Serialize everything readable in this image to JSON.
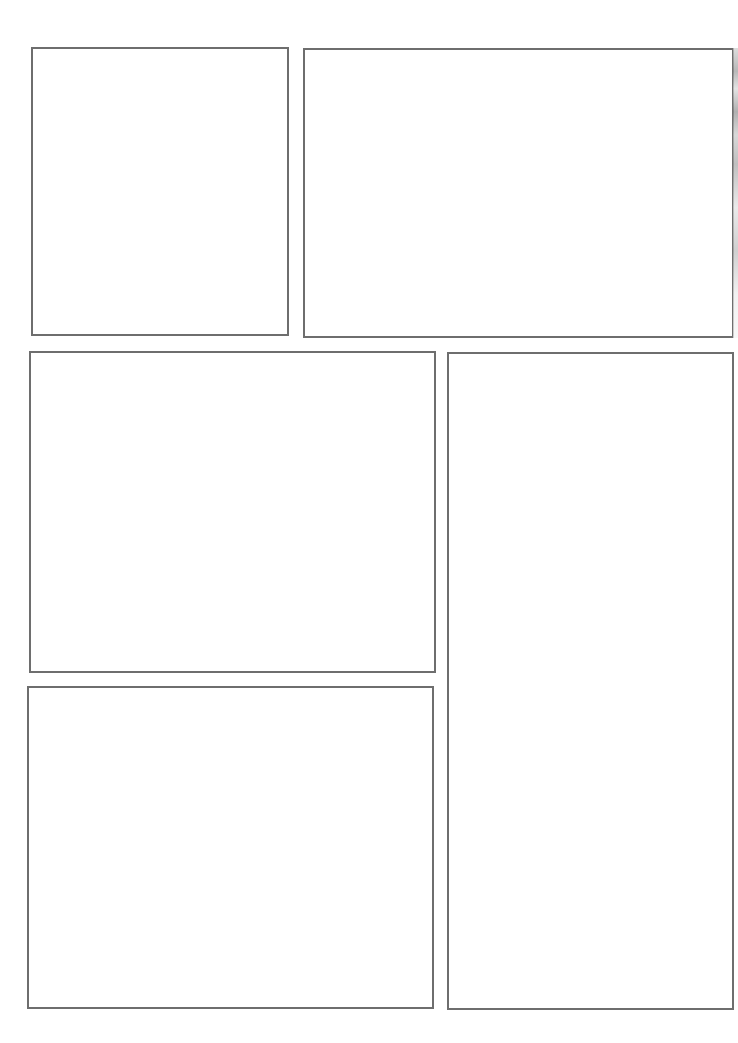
{
  "page": {
    "background": "#ffffff",
    "border_color": "#6e6e6e",
    "panels": [
      {
        "id": "panel-1",
        "left": 31,
        "top": 47,
        "width": 258,
        "height": 289
      },
      {
        "id": "panel-2",
        "left": 303,
        "top": 48,
        "width": 431,
        "height": 290
      },
      {
        "id": "panel-3",
        "left": 29,
        "top": 351,
        "width": 407,
        "height": 322
      },
      {
        "id": "panel-4",
        "left": 447,
        "top": 352,
        "width": 287,
        "height": 658
      },
      {
        "id": "panel-5",
        "left": 27,
        "top": 686,
        "width": 407,
        "height": 323
      }
    ]
  }
}
